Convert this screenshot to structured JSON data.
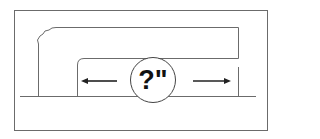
{
  "diagram": {
    "measurement_label": "?\"",
    "arrow_left": "left-arrow",
    "arrow_right": "right-arrow",
    "colors": {
      "line": "#6b6b6b",
      "arrow": "#222222",
      "text": "#111111",
      "background": "#ffffff"
    }
  }
}
